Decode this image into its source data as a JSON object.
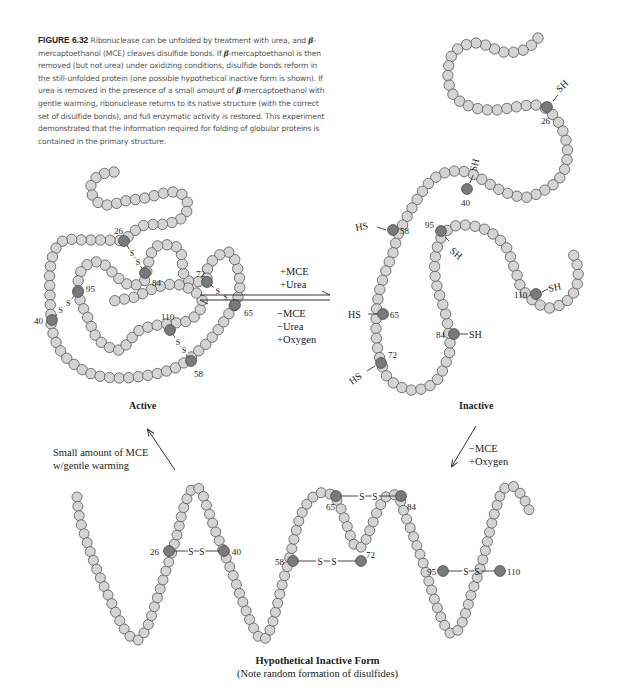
{
  "caption": {
    "figure_label": "FIGURE 6.32",
    "beta": "β",
    "part1": " Ribonuclease can be unfolded by treatment with urea, and ",
    "part2": "-mercaptoethanol (MCE) cleaves disulfide bonds. If ",
    "part3": "-mercaptoethanol is then removed (but not urea) under oxidizing conditions, disulfide bonds reform in the still-unfolded protein (one possible hypothetical inactive form is shown). If urea is removed in the presence of a small amount of ",
    "part4": "-mercaptoethanol with gentle warming, ribonuclease returns to its native structure (with the correct set of disulfide bonds), and full enzymatic activity is restored. This experiment demonstrated that the information required for folding of globular proteins is contained in the primary structure."
  },
  "colors": {
    "bead_fill": "#d4d4d4",
    "bead_stroke": "#555555",
    "cys_fill": "#7a7a7a",
    "line": "#333333",
    "text": "#222222"
  },
  "states": {
    "active": {
      "title": "Active",
      "residue_labels": [
        "26",
        "84",
        "72",
        "95",
        "40",
        "65",
        "110",
        "58"
      ],
      "disulfides": [
        [
          "26",
          "84"
        ],
        [
          "72",
          "65"
        ],
        [
          "95",
          "40"
        ],
        [
          "110",
          "58"
        ]
      ],
      "bond_label": "S–S"
    },
    "inactive": {
      "title": "Inactive",
      "residue_labels": [
        "26",
        "40",
        "58",
        "95",
        "65",
        "110",
        "84",
        "72"
      ],
      "thiol_labels": {
        "26": "SH",
        "40": "SH",
        "58": "HS",
        "95": "SH",
        "65": "HS",
        "110": "SH",
        "84": "SH",
        "72": "HS"
      }
    },
    "hypothetical": {
      "title": "Hypothetical Inactive Form",
      "subtitle": "(Note random formation of disulfides)",
      "residue_labels": [
        "26",
        "40",
        "65",
        "84",
        "58",
        "72",
        "95",
        "110"
      ],
      "disulfides": [
        [
          "26",
          "40"
        ],
        [
          "65",
          "84"
        ],
        [
          "58",
          "72"
        ],
        [
          "95",
          "110"
        ]
      ],
      "bond_label": "S–S"
    }
  },
  "arrows": {
    "forward": {
      "line1": "+MCE",
      "line2": "+Urea"
    },
    "reverse": {
      "line1": "−MCE",
      "line2": "−Urea",
      "line3": "+Oxygen"
    },
    "refold": {
      "line1": "Small amount of MCE",
      "line2": "w/gentle warming"
    },
    "oxidize": {
      "line1": "−MCE",
      "line2": "+Oxygen"
    }
  }
}
